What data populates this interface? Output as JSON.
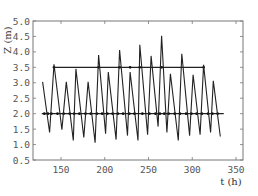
{
  "chart_data": {
    "type": "line",
    "title": "",
    "xlabel": "t (h)",
    "ylabel": "Z (m)",
    "xlim": [
      118,
      358
    ],
    "ylim": [
      0.5,
      5.0
    ],
    "xticks": [
      150,
      200,
      250,
      300,
      350
    ],
    "yticks": [
      0.5,
      1.0,
      1.5,
      2.0,
      2.5,
      3.0,
      3.5,
      4.0,
      4.5,
      5.0
    ],
    "ytick_labels": [
      "0.5",
      "1.0",
      "1.5",
      "2.0",
      "2.5",
      "3.0",
      "3.5",
      "4.0",
      "4.5",
      "5.0"
    ],
    "xtick_labels": [
      "150",
      "200",
      "250",
      "300",
      "350"
    ],
    "grid": false,
    "legend": null,
    "series": [
      {
        "name": "water level Z",
        "x": [
          129,
          137,
          142,
          151,
          156,
          164,
          167,
          176,
          181,
          189,
          193,
          201,
          204,
          213,
          217,
          226,
          229,
          238,
          240,
          249,
          253,
          261,
          265,
          271,
          275,
          284,
          288,
          297,
          301,
          309,
          313,
          321,
          324,
          332
        ],
        "values": [
          3.03,
          1.39,
          3.6,
          1.48,
          3.03,
          1.13,
          3.45,
          1.23,
          3.03,
          1.06,
          3.9,
          1.35,
          3.35,
          1.16,
          4.06,
          1.29,
          3.35,
          1.13,
          4.23,
          1.32,
          3.87,
          1.58,
          4.52,
          1.39,
          3.29,
          1.13,
          3.94,
          1.29,
          3.26,
          1.32,
          3.58,
          1.39,
          3.06,
          1.26
        ]
      },
      {
        "name": "upper reference level",
        "x": [
          142,
          313
        ],
        "values": [
          3.5,
          3.5
        ],
        "markers": [
          142,
          193,
          217,
          229,
          240,
          265,
          313
        ]
      },
      {
        "name": "lower reference level",
        "x": [
          128,
          336
        ],
        "values": [
          2.0,
          2.0
        ],
        "markers": [
          131,
          135,
          139,
          146,
          153,
          160,
          165,
          171,
          178,
          184,
          191,
          197,
          203,
          209,
          215,
          221,
          228,
          234,
          243,
          251,
          258,
          263,
          268,
          273,
          280,
          286,
          293,
          299,
          305,
          311,
          318,
          323,
          329
        ]
      }
    ]
  }
}
